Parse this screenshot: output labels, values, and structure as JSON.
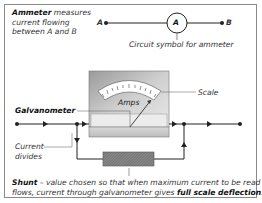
{
  "diagram": {
    "intro": {
      "term": "Ammeter",
      "line1_rest": " measures",
      "line2": "current flowing",
      "line3": "between A and B"
    },
    "symbol": {
      "terminal_a": "A",
      "terminal_b": "B",
      "circle_label": "A",
      "caption": "Circuit symbol for ammeter"
    },
    "meter": {
      "dial_label": "Amps",
      "scale_label": "Scale",
      "galvanometer_label": "Galvanometer",
      "current_divides_line1": "Current",
      "current_divides_line2": "divides"
    },
    "shunt_note": {
      "term": "Shunt",
      "text1": " – value chosen so that when maximum current to be read",
      "text2": "flows, current through galvanometer gives ",
      "emphasis": "full scale deflection",
      "end": "."
    },
    "colors": {
      "line": "#222222",
      "meter_body": "#b8b8b8",
      "meter_face": "#ffffff",
      "shunt": "#7a7a7a",
      "frame": "#8a8a8a"
    }
  }
}
